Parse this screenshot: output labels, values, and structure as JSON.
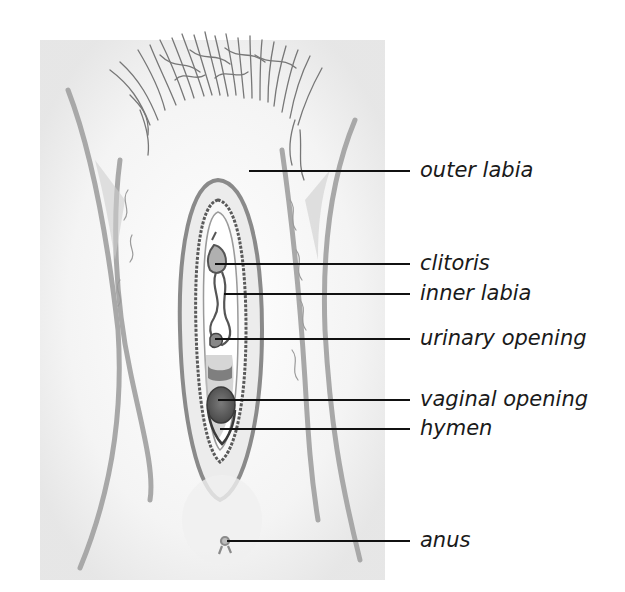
{
  "diagram": {
    "type": "labeled-anatomical-illustration",
    "labels": [
      {
        "id": "outer-labia",
        "text": "outer labia",
        "y": 171,
        "line_start_x": 249,
        "line_end_x": 410
      },
      {
        "id": "clitoris",
        "text": "clitoris",
        "y": 264,
        "line_start_x": 215,
        "line_end_x": 410
      },
      {
        "id": "inner-labia",
        "text": "inner labia",
        "y": 294,
        "line_start_x": 224,
        "line_end_x": 410
      },
      {
        "id": "urinary-opening",
        "text": "urinary opening",
        "y": 339,
        "line_start_x": 215,
        "line_end_x": 410
      },
      {
        "id": "vaginal-opening",
        "text": "vaginal opening",
        "y": 400,
        "line_start_x": 218,
        "line_end_x": 410
      },
      {
        "id": "hymen",
        "text": "hymen",
        "y": 429,
        "line_start_x": 220,
        "line_end_x": 410
      },
      {
        "id": "anus",
        "text": "anus",
        "y": 541,
        "line_start_x": 227,
        "line_end_x": 410
      }
    ],
    "colors": {
      "background": "#ffffff",
      "shading": "#d9d9d9",
      "outline": "#8a8a8a",
      "dark_outline": "#3a3a3a",
      "opening_fill": "#6a6a6a",
      "leader_line": "#111111",
      "label_text": "#1a1a1a"
    }
  }
}
